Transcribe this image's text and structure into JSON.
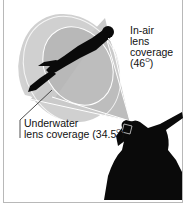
{
  "diagram": {
    "type": "illustration",
    "labels": {
      "in_air": {
        "line1": "In-air",
        "line2": "lens",
        "line3": "coverage",
        "angle_open": "(46",
        "angle_sup": "O",
        "angle_close": ")"
      },
      "underwater": {
        "line1": "Underwater",
        "line2_prefix": "lens coverage (34.5",
        "angle_sup": "O",
        "angle_close": ")"
      }
    },
    "figures": [
      "diver-silhouette",
      "photographer-silhouette"
    ],
    "colors": {
      "cone_fill": "#c8c8c8",
      "inner_cone": "#b4b4b4",
      "silhouette": "#0a0a0a",
      "lines": "#ffffff",
      "frame": "#b8b8b8"
    }
  }
}
